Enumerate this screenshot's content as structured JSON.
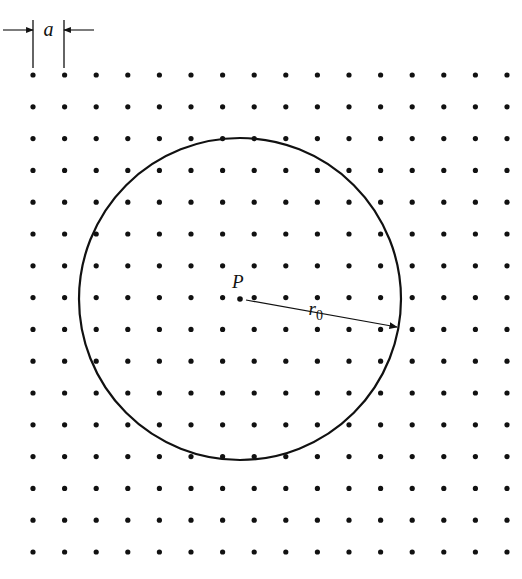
{
  "figure": {
    "background": "#ffffff",
    "ink_color": "#111111",
    "lattice": {
      "label": "a",
      "rows": 16,
      "cols": 16,
      "origin_x": 33,
      "origin_y": 75,
      "pitch_x": 31.6,
      "pitch_y": 31.8,
      "dot_radius": 2.6
    },
    "circle": {
      "cx": 240,
      "cy": 299,
      "r": 161,
      "stroke_width": 2.2
    },
    "point": {
      "label": "P",
      "x": 240,
      "y": 299
    },
    "radius_vector": {
      "label": "r",
      "subscript": "0",
      "from_x": 240,
      "from_y": 299,
      "to_x": 397,
      "to_y": 327
    },
    "spacing_marker": {
      "left_x": 33,
      "right_x": 64,
      "arrow_y": 30,
      "line_top": 20,
      "line_bottom": 68
    }
  }
}
